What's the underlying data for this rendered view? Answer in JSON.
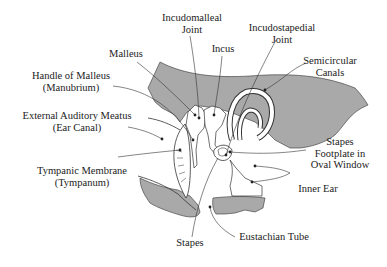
{
  "diagram": {
    "type": "anatomical-diagram",
    "colors": {
      "bone_fill": "#a9a9a9",
      "line": "#333333",
      "text": "#222222",
      "background": "#ffffff"
    },
    "labels": [
      {
        "id": "incudomalleal-joint",
        "lines": [
          "Incudomalleal",
          "Joint"
        ]
      },
      {
        "id": "incus",
        "lines": [
          "Incus"
        ]
      },
      {
        "id": "incudostapedial-joint",
        "lines": [
          "Incudostapedial",
          "Joint"
        ]
      },
      {
        "id": "malleus",
        "lines": [
          "Malleus"
        ]
      },
      {
        "id": "semicircular-canals",
        "lines": [
          "Semicircular",
          "Canals"
        ]
      },
      {
        "id": "handle-of-malleus",
        "lines": [
          "Handle of Malleus",
          "(Manubrium)"
        ]
      },
      {
        "id": "external-auditory-meatus",
        "lines": [
          "External Auditory Meatus",
          "(Ear Canal)"
        ]
      },
      {
        "id": "stapes-footplate",
        "lines": [
          "Stapes",
          "Footplate in",
          "Oval Window"
        ]
      },
      {
        "id": "tympanic-membrane",
        "lines": [
          "Tympanic Membrane",
          "(Tympanum)"
        ]
      },
      {
        "id": "inner-ear",
        "lines": [
          "Inner Ear"
        ]
      },
      {
        "id": "stapes",
        "lines": [
          "Stapes"
        ]
      },
      {
        "id": "eustachian-tube",
        "lines": [
          "Eustachian Tube"
        ]
      }
    ]
  }
}
